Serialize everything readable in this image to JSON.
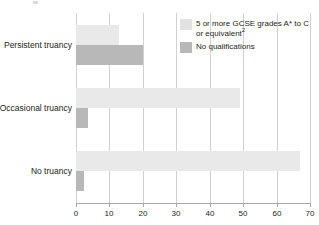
{
  "chart_data": {
    "type": "bar",
    "orientation": "horizontal",
    "title": "",
    "subtitle": "",
    "xlabel": "",
    "ylabel": "",
    "categories": [
      "Persistent truancy",
      "Occasional truancy",
      "No truancy"
    ],
    "series": [
      {
        "name": "5 or more GCSE grades A* to C or equivalent",
        "name_sup": "2",
        "color": "#e9e9e9",
        "values": [
          13,
          49,
          67
        ]
      },
      {
        "name": "No qualifications",
        "color": "#b8b8b8",
        "values": [
          20,
          3.5,
          2.5
        ]
      }
    ],
    "xlim": [
      0,
      70
    ],
    "xticks": [
      "0",
      "10",
      "20",
      "30",
      "40",
      "50",
      "60",
      "70"
    ],
    "xtick_values": [
      0,
      10,
      20,
      30,
      40,
      50,
      60,
      70
    ],
    "grid": "vertical",
    "legend_position": "top-right"
  },
  "legend": {
    "entries": [
      {
        "label_line1": "5 or more GCSE grades A* to C",
        "label_line2": "or equivalent",
        "superscript": "2"
      },
      {
        "label_line1": "No qualifications",
        "label_line2": "",
        "superscript": ""
      }
    ]
  },
  "colors": {
    "series_light": "#e9e9e9",
    "series_dark": "#b8b8b8",
    "gridline": "#d2d2d2",
    "axis": "#a9a9a9",
    "text": "#231f20",
    "background": "#ffffff"
  }
}
